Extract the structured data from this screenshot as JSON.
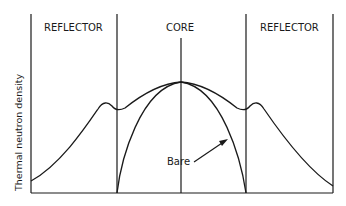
{
  "diagram": {
    "region_labels": {
      "left_reflector": "REFLECTOR",
      "core": "CORE",
      "right_reflector": "REFLECTOR"
    },
    "ylabel": "Thermal neutron density",
    "annotation": "Bare",
    "curves": [
      {
        "name": "reflected",
        "description": "Flattened flux with reflector peaks"
      },
      {
        "name": "bare",
        "description": "Cosine-like flux dropping to zero at core boundary"
      }
    ],
    "colors": {
      "ink": "#1a1a1a",
      "background": "#ffffff"
    }
  }
}
